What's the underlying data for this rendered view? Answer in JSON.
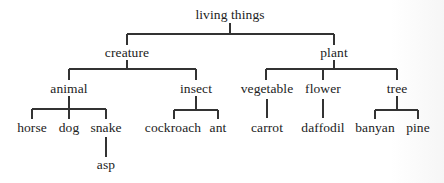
{
  "diagram": {
    "type": "tree",
    "root": "living things",
    "nodes": {
      "living_things": {
        "label": "living things",
        "x": 230,
        "y": 15
      },
      "creature": {
        "label": "creature",
        "x": 127,
        "y": 53
      },
      "plant": {
        "label": "plant",
        "x": 334,
        "y": 53
      },
      "animal": {
        "label": "animal",
        "x": 69,
        "y": 89
      },
      "insect": {
        "label": "insect",
        "x": 196,
        "y": 89
      },
      "vegetable": {
        "label": "vegetable",
        "x": 267,
        "y": 89
      },
      "flower": {
        "label": "flower",
        "x": 323,
        "y": 89
      },
      "tree": {
        "label": "tree",
        "x": 397,
        "y": 89
      },
      "horse": {
        "label": "horse",
        "x": 32,
        "y": 128
      },
      "dog": {
        "label": "dog",
        "x": 69,
        "y": 128
      },
      "snake": {
        "label": "snake",
        "x": 106,
        "y": 128
      },
      "asp": {
        "label": "asp",
        "x": 106,
        "y": 165
      },
      "cockroach": {
        "label": "cockroach",
        "x": 173,
        "y": 128
      },
      "ant": {
        "label": "ant",
        "x": 218,
        "y": 128
      },
      "carrot": {
        "label": "carrot",
        "x": 267,
        "y": 128
      },
      "daffodil": {
        "label": "daffodil",
        "x": 323,
        "y": 128
      },
      "banyan": {
        "label": "banyan",
        "x": 375,
        "y": 128
      },
      "pine": {
        "label": "pine",
        "x": 418,
        "y": 128
      }
    },
    "edges": [
      [
        "living things",
        "creature"
      ],
      [
        "living things",
        "plant"
      ],
      [
        "creature",
        "animal"
      ],
      [
        "creature",
        "insect"
      ],
      [
        "animal",
        "horse"
      ],
      [
        "animal",
        "dog"
      ],
      [
        "animal",
        "snake"
      ],
      [
        "snake",
        "asp"
      ],
      [
        "insect",
        "cockroach"
      ],
      [
        "insect",
        "ant"
      ],
      [
        "plant",
        "vegetable"
      ],
      [
        "plant",
        "flower"
      ],
      [
        "plant",
        "tree"
      ],
      [
        "vegetable",
        "carrot"
      ],
      [
        "flower",
        "daffodil"
      ],
      [
        "tree",
        "banyan"
      ],
      [
        "tree",
        "pine"
      ]
    ]
  }
}
